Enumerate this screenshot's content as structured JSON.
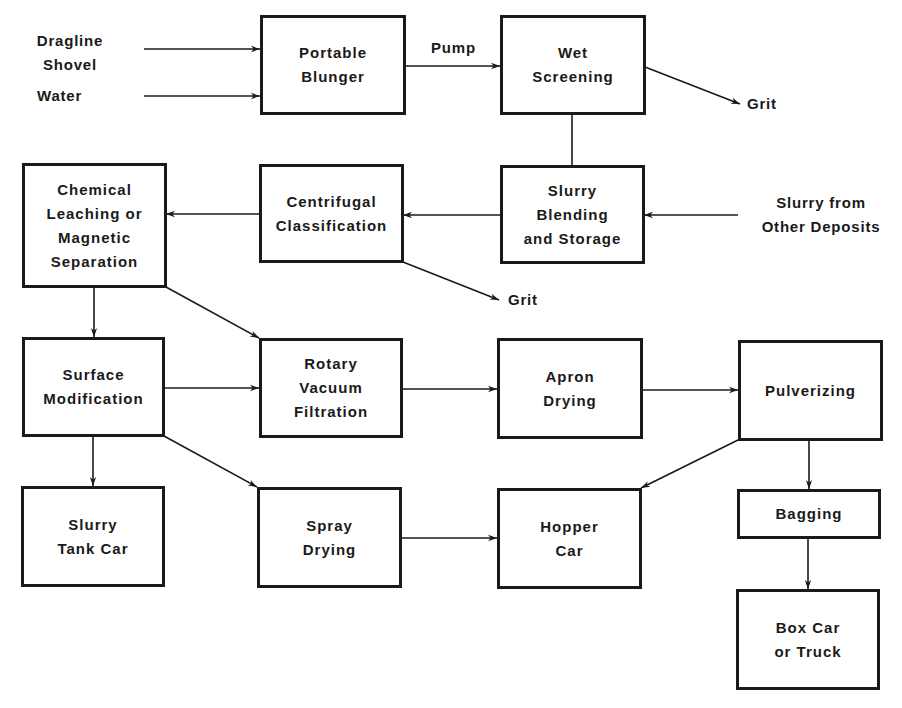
{
  "diagram": {
    "type": "process-flow",
    "boxes": {
      "portable_blunger": "Portable\nBlunger",
      "wet_screening": "Wet\nScreening",
      "chemical_leaching": "Chemical\nLeaching or\nMagnetic\nSeparation",
      "centrifugal_classification": "Centrifugal\nClassification",
      "slurry_blending": "Slurry\nBlending\nand Storage",
      "surface_modification": "Surface\nModification",
      "rotary_vacuum_filtration": "Rotary\nVacuum\nFiltration",
      "apron_drying": "Apron\nDrying",
      "pulverizing": "Pulverizing",
      "slurry_tank_car": "Slurry\nTank Car",
      "spray_drying": "Spray\nDrying",
      "hopper_car": "Hopper\nCar",
      "bagging": "Bagging",
      "box_car": "Box Car\nor Truck"
    },
    "external_labels": {
      "dragline": "Dragline\nShovel",
      "water": "Water",
      "pump": "Pump",
      "grit_1": "Grit",
      "grit_2": "Grit",
      "slurry_other": "Slurry from\nOther Deposits"
    },
    "edges": [
      {
        "from": "Dragline Shovel",
        "to": "Portable Blunger"
      },
      {
        "from": "Water",
        "to": "Portable Blunger"
      },
      {
        "from": "Portable Blunger",
        "to": "Wet Screening",
        "label": "Pump"
      },
      {
        "from": "Wet Screening",
        "to": "Grit"
      },
      {
        "from": "Wet Screening",
        "to": "Slurry Blending and Storage"
      },
      {
        "from": "Slurry from Other Deposits",
        "to": "Slurry Blending and Storage"
      },
      {
        "from": "Slurry Blending and Storage",
        "to": "Centrifugal Classification"
      },
      {
        "from": "Centrifugal Classification",
        "to": "Chemical Leaching or Magnetic Separation"
      },
      {
        "from": "Centrifugal Classification",
        "to": "Grit"
      },
      {
        "from": "Chemical Leaching or Magnetic Separation",
        "to": "Surface Modification"
      },
      {
        "from": "Chemical Leaching or Magnetic Separation",
        "to": "Rotary Vacuum Filtration"
      },
      {
        "from": "Surface Modification",
        "to": "Rotary Vacuum Filtration"
      },
      {
        "from": "Surface Modification",
        "to": "Slurry Tank Car"
      },
      {
        "from": "Surface Modification",
        "to": "Spray Drying"
      },
      {
        "from": "Rotary Vacuum Filtration",
        "to": "Apron Drying"
      },
      {
        "from": "Apron Drying",
        "to": "Pulverizing"
      },
      {
        "from": "Pulverizing",
        "to": "Hopper Car"
      },
      {
        "from": "Pulverizing",
        "to": "Bagging"
      },
      {
        "from": "Spray Drying",
        "to": "Hopper Car"
      },
      {
        "from": "Bagging",
        "to": "Box Car or Truck"
      }
    ]
  }
}
